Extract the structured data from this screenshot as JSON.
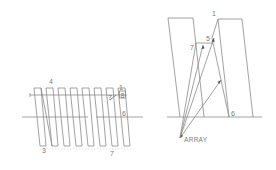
{
  "diagram": {
    "left": {
      "labels": {
        "top_left": "4",
        "top_right": "1",
        "right_upper": "8",
        "inner": "7",
        "right_mid": "6",
        "bottom_left": "3",
        "bottom_right": "7"
      },
      "bar_count": 8
    },
    "right": {
      "labels": {
        "top": "1",
        "upper_mid": "5",
        "left_mid": "7",
        "bottom_right": "6",
        "array": "ARRAY"
      }
    },
    "colors": {
      "line": "#8a8a8a",
      "text": "#7a7a7a",
      "background": "#ffffff"
    }
  }
}
